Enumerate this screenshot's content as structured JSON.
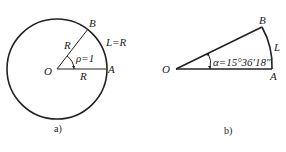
{
  "figure_a": {
    "caption": "a)",
    "center_label": "O",
    "point_a_label": "A",
    "point_b_label": "B",
    "radius_label_upper": "R",
    "radius_label_lower": "R",
    "angle_label": "ρ=1",
    "arc_label": "L=R"
  },
  "figure_b": {
    "caption": "b)",
    "center_label": "O",
    "point_a_label": "A",
    "point_b_label": "B",
    "angle_label": "α=15°36′18″",
    "arc_label": "L"
  }
}
